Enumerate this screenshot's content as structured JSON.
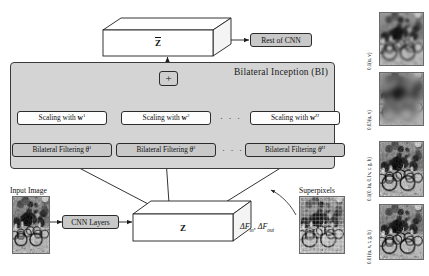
{
  "figure": {
    "type": "architecture-diagram",
    "panel": {
      "title": "Bilateral Inception (BI)"
    },
    "top_cube": {
      "label": "Z",
      "accent": "overbar",
      "label_full": "Z̄"
    },
    "bottom_cube": {
      "label": "Z"
    },
    "plus_node": {
      "symbol": "+"
    },
    "rest_of_cnn": {
      "label": "Rest of CNN"
    },
    "cnn_layers": {
      "label": "CNN Layers"
    },
    "scaling_boxes": [
      {
        "label_prefix": "Scaling with ",
        "symbol": "w",
        "exponent": "1"
      },
      {
        "label_prefix": "Scaling with ",
        "symbol": "w",
        "exponent": "2"
      },
      {
        "label_prefix": "Scaling with ",
        "symbol": "w",
        "exponent": "H"
      }
    ],
    "filter_boxes": [
      {
        "label_prefix": "Bilateral Filtering ",
        "symbol": "θ",
        "exponent": "1"
      },
      {
        "label_prefix": "Bilateral Filtering ",
        "symbol": "θ",
        "exponent": "2"
      },
      {
        "label_prefix": "Bilateral Filtering ",
        "symbol": "θ",
        "exponent": "H"
      }
    ],
    "ellipsis": "· · ·",
    "captions": {
      "input_image": "Input Image",
      "superpixels": "Superpixels"
    },
    "delta_label": {
      "text": "ΔF_in, ΔF_out",
      "parts": [
        "ΔF",
        "in",
        ", ΔF",
        "out"
      ]
    },
    "kernel_labels": [
      "0.1(u, v)",
      "0.05(u, v)",
      "0.1(0.1u, 0.1v, r, g, b)",
      "0.01(u, v, r, g, b)"
    ],
    "colors": {
      "panel_fill": "#d4d4d4",
      "node_fill": "#c9c9c9",
      "light_fill": "#fdfdfd",
      "stroke": "#2b2b2b",
      "background": "#ffffff"
    }
  }
}
